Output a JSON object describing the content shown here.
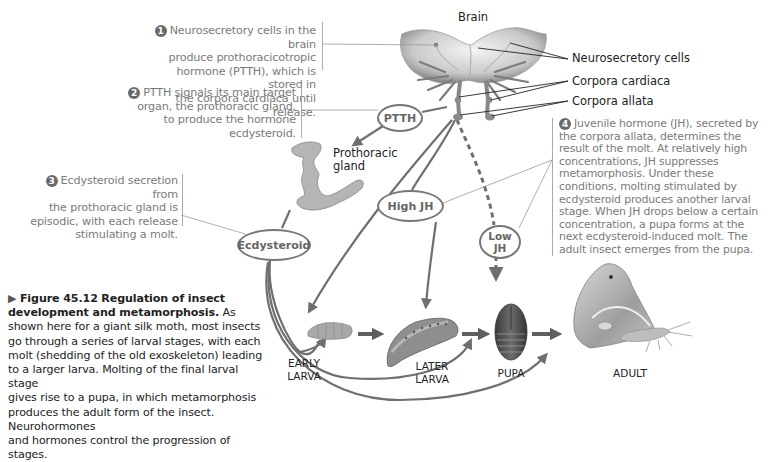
{
  "diagram": {
    "title": "Regulation of insect development and metamorphosis",
    "structure_labels": {
      "brain": "Brain",
      "neurosecretory_cells": "Neurosecretory cells",
      "corpora_cardiaca": "Corpora cardiaca",
      "corpora_allata": "Corpora allata",
      "prothoracic_gland": "Prothoracic gland"
    },
    "hormone_nodes": {
      "ptth": "PTTH",
      "high_jh": "High JH",
      "low_jh": "Low JH",
      "ecdysteroid": "Ecdysteroid"
    },
    "stages": [
      {
        "label_line1": "EARLY",
        "label_line2": "LARVA"
      },
      {
        "label_line1": "LATER",
        "label_line2": "LARVA"
      },
      {
        "label_line1": "PUPA",
        "label_line2": ""
      },
      {
        "label_line1": "ADULT",
        "label_line2": ""
      }
    ],
    "annotations": [
      {
        "number": "1",
        "text": "Neurosecretory cells in the brain produce prothoracicotropic hormone (PTTH), which is stored in the corpora cardiaca until release.",
        "lines": [
          "Neurosecretory cells in the brain",
          "produce prothoracicotropic",
          "hormone (PTTH), which is stored in",
          "the corpora cardiaca until release."
        ]
      },
      {
        "number": "2",
        "text": "PTTH signals its main target organ, the prothoracic gland, to produce the hormone ecdysteroid.",
        "lines": [
          "PTTH signals its main target",
          "organ, the prothoracic gland,",
          "to produce the hormone",
          "ecdysteroid."
        ]
      },
      {
        "number": "3",
        "text": "Ecdysteroid secretion from the prothoracic gland is episodic, with each release stimulating a molt.",
        "lines": [
          "Ecdysteroid secretion from",
          "the prothoracic gland is",
          "episodic, with each release",
          "stimulating a molt."
        ]
      },
      {
        "number": "4",
        "text": "Juvenile hormone (JH), secreted by the corpora allata, determines the result of the molt. At relatively high concentrations, JH suppresses metamorphosis. Under these conditions, molting stimulated by ecdysteroid produces another larval stage. When JH drops below a certain concentration, a pupa forms at the next ecdysteroid-induced molt. The adult insect emerges from the pupa.",
        "lines": [
          "Juvenile hormone (JH), secreted by",
          "the corpora allata, determines the",
          "result of the molt. At relatively high",
          "concentrations, JH suppresses",
          "metamorphosis. Under these",
          "conditions, molting stimulated by",
          "ecdysteroid produces another larval",
          "stage. When JH drops below a certain",
          "concentration, a pupa forms at the",
          "next ecdysteroid-induced molt. The",
          "adult insect emerges from the pupa."
        ]
      }
    ],
    "caption": {
      "marker": "▶",
      "figure_number": "Figure 45.12",
      "bold_title": "Regulation of insect development and metamorphosis.",
      "lines": [
        "As",
        "shown here for a giant silk moth, most insects",
        "go through a series of larval stages, with each",
        "molt (shedding of the old exoskeleton) leading",
        "to a larger larva. Molting of the final larval stage",
        "gives rise to a pupa, in which metamorphosis",
        "produces the adult form of the insect. Neurohormones",
        "and hormones control the progression of stages."
      ]
    },
    "colors": {
      "arrow": "#6f6f6f",
      "annotation_text": "#7a7a7a",
      "label_text": "#222222",
      "ellipse_border": "#777777",
      "number_badge": "#6a6a6a"
    }
  }
}
